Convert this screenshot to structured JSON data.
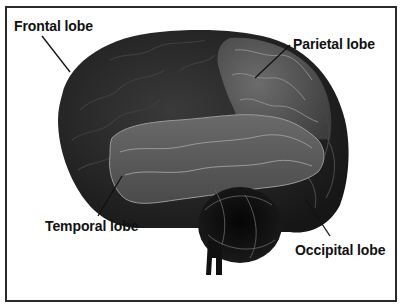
{
  "diagram": {
    "labels": {
      "frontal": "Frontal lobe",
      "parietal": "Parietal lobe",
      "temporal": "Temporal lobe",
      "occipital": "Occipital lobe"
    },
    "colors": {
      "frontal_fill": "#232323",
      "parietal_fill": "#555555",
      "temporal_fill": "#5e5e5e",
      "occipital_fill": "#2a2a2a",
      "cerebellum_fill": "#0c0c0c",
      "highlight": "#9a9a9a",
      "frame": "#2a2a2a",
      "text": "#111111"
    }
  }
}
